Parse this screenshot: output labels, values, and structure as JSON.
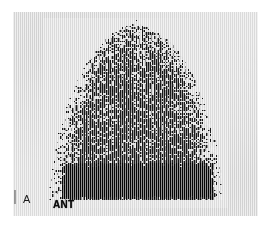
{
  "figure": {
    "kind": "nuclear-medicine-scintigram",
    "panel_letter": "A",
    "view_label": "ANT"
  },
  "colors": {
    "page_background": "#ffffff",
    "film_background": "#e3e3e3",
    "speckle_dark": "#111111",
    "speckle_light": "#e9e9e9",
    "band_black": "#050505",
    "label_text": "#141414",
    "tick_mark": "#5a5a5a"
  },
  "layout": {
    "page_width": 270,
    "page_height": 228,
    "film_left": 13,
    "film_top": 12,
    "film_width": 245,
    "film_height": 204,
    "uptake_left": 30,
    "uptake_top": 6,
    "uptake_width": 185,
    "uptake_height": 190
  },
  "image_data": {
    "type": "scintigram",
    "render_seed": 20240517,
    "grid_cols": 120,
    "grid_rows": 126,
    "dome_center_x": 0.5,
    "dome_base_y": 0.93,
    "dome_half_width": 0.47,
    "dome_height": 0.9,
    "band_top": 0.76,
    "band_bottom": 0.95,
    "band_left": 0.1,
    "band_right": 0.92,
    "speckle_density_peak": 0.95,
    "speckle_density_edge": 0.1,
    "scanline_contrast": 0.22,
    "description": "Dome / bell shaped radiotracer uptake region with dense random dot speckle, hottest (darkest) near the upper-central dome and a confluent solid black band across the base."
  }
}
